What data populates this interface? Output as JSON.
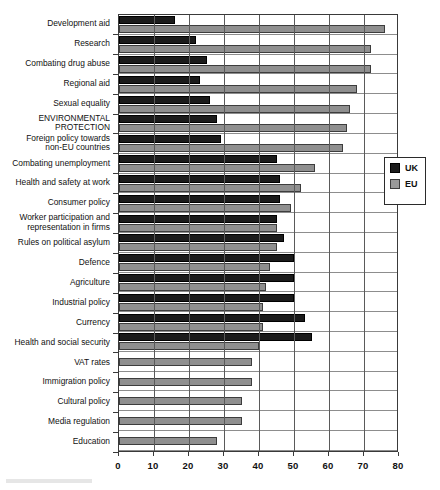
{
  "chart_data": {
    "type": "bar",
    "orientation": "horizontal",
    "title": "",
    "xlabel": "",
    "ylabel": "",
    "xlim": [
      0,
      80
    ],
    "xticks": [
      0,
      10,
      20,
      30,
      40,
      50,
      60,
      70,
      80
    ],
    "grid": true,
    "legend_position": "right",
    "categories": [
      "Development aid",
      "Research",
      "Combating drug abuse",
      "Regional aid",
      "Sexual equality",
      "ENVIRONMENTAL\nPROTECTION",
      "Foreign policy towards\nnon-EU countries",
      "Combating unemployment",
      "Health and safety at work",
      "Consumer policy",
      "Worker participation and\nrepresentation in firms",
      "Rules on political asylum",
      "Defence",
      "Agriculture",
      "Industrial policy",
      "Currency",
      "Health and social security",
      "VAT rates",
      "Immigration policy",
      "Cultural policy",
      "Media regulation",
      "Education"
    ],
    "series": [
      {
        "name": "UK",
        "color": "#1b1b1b",
        "values": [
          16,
          22,
          25,
          23,
          26,
          28,
          29,
          45,
          46,
          46,
          45,
          47,
          50,
          50,
          50,
          53,
          55,
          null,
          null,
          null,
          null,
          null
        ]
      },
      {
        "name": "EU",
        "color": "#8f8f8f",
        "values": [
          76,
          72,
          72,
          68,
          66,
          65,
          64,
          56,
          52,
          49,
          45,
          45,
          43,
          42,
          41,
          41,
          40,
          38,
          38,
          35,
          35,
          28
        ]
      }
    ]
  },
  "legend": {
    "entries": [
      {
        "label": "UK",
        "swatch": "black-square-swatch"
      },
      {
        "label": "EU",
        "swatch": "gray-square-swatch"
      }
    ]
  },
  "axis": {
    "x_tick_labels": [
      "0",
      "10",
      "20",
      "30",
      "40",
      "50",
      "60",
      "70",
      "80"
    ]
  }
}
